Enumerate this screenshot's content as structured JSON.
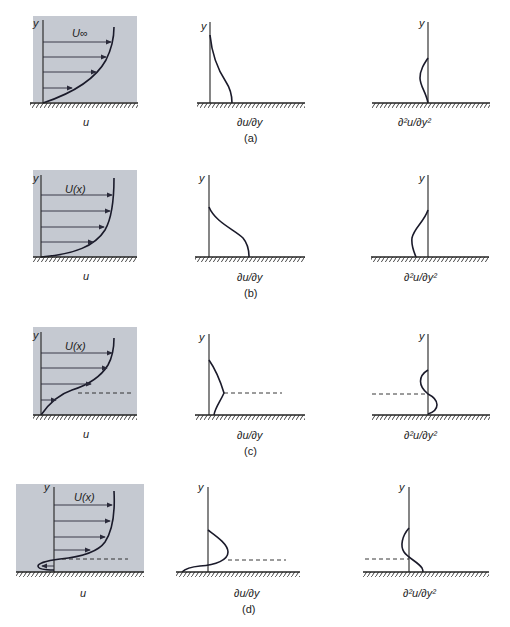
{
  "figure": {
    "colors": {
      "panel": "#c5c9d1",
      "line": "#1a1a2a"
    },
    "rows": [
      {
        "caption": "(a)",
        "velocity_label": "U∞",
        "u_label": "u",
        "axis_label": "y",
        "du_label": "∂u/∂y",
        "d2u_label": "∂²u/∂y²",
        "description": "Favorable pressure gradient: no inflection, d²u/dy² < 0 throughout"
      },
      {
        "caption": "(b)",
        "velocity_label": "U(x)",
        "u_label": "u",
        "axis_label": "y",
        "du_label": "∂u/∂y",
        "d2u_label": "∂²u/∂y²",
        "description": "Zero pressure gradient"
      },
      {
        "caption": "(c)",
        "velocity_label": "U(x)",
        "u_label": "u",
        "axis_label": "y",
        "du_label": "∂u/∂y",
        "d2u_label": "∂²u/∂y²",
        "description": "Adverse pressure gradient: inflection point (dashed line)"
      },
      {
        "caption": "(d)",
        "velocity_label": "U(x)",
        "u_label": "u",
        "axis_label": "y",
        "du_label": "∂u/∂y",
        "d2u_label": "∂²u/∂y²",
        "description": "Separated flow with reverse flow near wall, inflection point (dashed line)"
      }
    ]
  }
}
